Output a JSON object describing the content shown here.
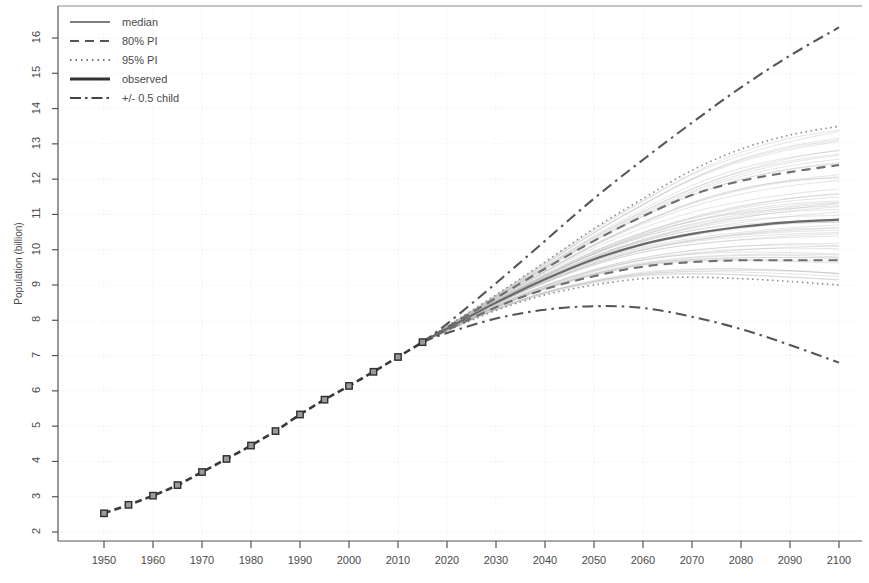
{
  "chart_data": {
    "type": "line",
    "title": "",
    "xlabel": "",
    "ylabel": "Population (billion)",
    "xlim": [
      1950,
      2100
    ],
    "ylim": [
      2,
      16.5
    ],
    "grid": true,
    "legend_position": "top-left",
    "x_ticks": [
      1950,
      1960,
      1970,
      1980,
      1990,
      2000,
      2010,
      2020,
      2030,
      2040,
      2050,
      2060,
      2070,
      2080,
      2090,
      2100
    ],
    "y_ticks": [
      2,
      3,
      4,
      5,
      6,
      7,
      8,
      9,
      10,
      11,
      12,
      13,
      14,
      15,
      16
    ],
    "legend": [
      {
        "label": "median",
        "style": "solid-thin",
        "color": "#555555"
      },
      {
        "label": "80% PI",
        "style": "dashed",
        "color": "#555555"
      },
      {
        "label": "95% PI",
        "style": "dotted",
        "color": "#777777"
      },
      {
        "label": "observed",
        "style": "solid-thick",
        "color": "#333333"
      },
      {
        "label": "+/- 0.5 child",
        "style": "dashdot",
        "color": "#444444"
      }
    ],
    "series": [
      {
        "name": "observed",
        "style": "solid-thick-markers",
        "marker": "square",
        "x": [
          1950,
          1955,
          1960,
          1965,
          1970,
          1975,
          1980,
          1985,
          1990,
          1995,
          2000,
          2005,
          2010,
          2015
        ],
        "values": [
          2.53,
          2.77,
          3.03,
          3.33,
          3.7,
          4.07,
          4.45,
          4.86,
          5.33,
          5.75,
          6.14,
          6.54,
          6.96,
          7.38
        ]
      },
      {
        "name": "median",
        "style": "solid-thin",
        "x": [
          2015,
          2020,
          2030,
          2040,
          2050,
          2060,
          2070,
          2080,
          2090,
          2100
        ],
        "values": [
          7.38,
          7.76,
          8.5,
          9.16,
          9.73,
          10.16,
          10.45,
          10.65,
          10.78,
          10.85
        ]
      },
      {
        "name": "80% PI upper",
        "style": "dashed",
        "x": [
          2015,
          2020,
          2030,
          2040,
          2050,
          2060,
          2070,
          2080,
          2090,
          2100
        ],
        "values": [
          7.38,
          7.8,
          8.63,
          9.46,
          10.25,
          10.95,
          11.55,
          11.95,
          12.2,
          12.4
        ]
      },
      {
        "name": "80% PI lower",
        "style": "dashed",
        "x": [
          2015,
          2020,
          2030,
          2040,
          2050,
          2060,
          2070,
          2080,
          2090,
          2100
        ],
        "values": [
          7.38,
          7.72,
          8.37,
          8.88,
          9.25,
          9.52,
          9.65,
          9.7,
          9.7,
          9.7
        ]
      },
      {
        "name": "95% PI upper",
        "style": "dotted",
        "x": [
          2015,
          2020,
          2030,
          2040,
          2050,
          2060,
          2070,
          2080,
          2090,
          2100
        ],
        "values": [
          7.38,
          7.83,
          8.72,
          9.65,
          10.6,
          11.45,
          12.25,
          12.85,
          13.25,
          13.5
        ]
      },
      {
        "name": "95% PI lower",
        "style": "dotted",
        "x": [
          2015,
          2020,
          2030,
          2040,
          2050,
          2060,
          2070,
          2080,
          2090,
          2100
        ],
        "values": [
          7.38,
          7.7,
          8.28,
          8.72,
          9.0,
          9.18,
          9.22,
          9.18,
          9.1,
          9.0
        ]
      },
      {
        "name": "+0.5 child",
        "style": "dashdot",
        "x": [
          2015,
          2020,
          2030,
          2040,
          2050,
          2060,
          2070,
          2080,
          2090,
          2100
        ],
        "values": [
          7.38,
          7.9,
          9.05,
          10.25,
          11.45,
          12.55,
          13.6,
          14.6,
          15.5,
          16.3
        ]
      },
      {
        "name": "-0.5 child",
        "style": "dashdot",
        "x": [
          2015,
          2020,
          2030,
          2040,
          2050,
          2060,
          2070,
          2080,
          2090,
          2100
        ],
        "values": [
          7.38,
          7.64,
          8.05,
          8.3,
          8.4,
          8.35,
          8.1,
          7.75,
          7.3,
          6.8
        ]
      }
    ],
    "trajectory_fan": {
      "count": 60,
      "color": "#b5b5b5",
      "description": "light gray simulated trajectory sample paths"
    }
  }
}
